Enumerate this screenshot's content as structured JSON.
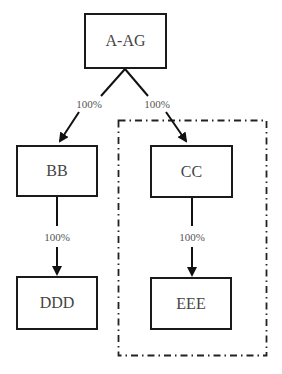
{
  "diagram": {
    "type": "ownership-structure",
    "nodes": [
      {
        "id": "aag",
        "label": "A-AG"
      },
      {
        "id": "bb",
        "label": "BB"
      },
      {
        "id": "cc",
        "label": "CC"
      },
      {
        "id": "ddd",
        "label": "DDD"
      },
      {
        "id": "eee",
        "label": "EEE"
      }
    ],
    "edges": [
      {
        "from": "A-AG",
        "to": "BB",
        "label": "100%"
      },
      {
        "from": "A-AG",
        "to": "CC",
        "label": "100%"
      },
      {
        "from": "BB",
        "to": "DDD",
        "label": "100%"
      },
      {
        "from": "CC",
        "to": "EEE",
        "label": "100%"
      }
    ],
    "group": {
      "style": "dash-dot",
      "members": [
        "CC",
        "EEE"
      ]
    }
  }
}
